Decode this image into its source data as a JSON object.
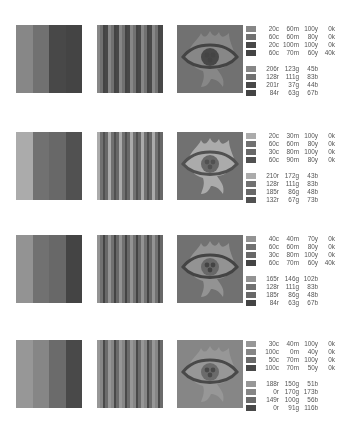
{
  "sets": [
    {
      "top": 25,
      "colors_rgb": [
        "#ce7b2d",
        "#806f53",
        "#c9252c",
        "#543f43"
      ],
      "cmyk": [
        {
          "c": "20c",
          "m": "60m",
          "y": "100y",
          "k": "0k"
        },
        {
          "c": "60c",
          "m": "60m",
          "y": "80y",
          "k": "0k"
        },
        {
          "c": "20c",
          "m": "100m",
          "y": "100y",
          "k": "0k"
        },
        {
          "c": "60c",
          "m": "70m",
          "y": "60y",
          "k": "40k"
        }
      ],
      "rgb": [
        {
          "r": "206r",
          "g": "123g",
          "b": "45b"
        },
        {
          "r": "128r",
          "g": "111g",
          "b": "83b"
        },
        {
          "r": "201r",
          "g": "37g",
          "b": "44b"
        },
        {
          "r": "84r",
          "g": "63g",
          "b": "67b"
        }
      ]
    },
    {
      "top": 132,
      "colors_rgb": [
        "#d2ac2b",
        "#806f53",
        "#b95630",
        "#844349"
      ],
      "cmyk": [
        {
          "c": "20c",
          "m": "30m",
          "y": "100y",
          "k": "0k"
        },
        {
          "c": "60c",
          "m": "60m",
          "y": "80y",
          "k": "0k"
        },
        {
          "c": "30c",
          "m": "80m",
          "y": "100y",
          "k": "0k"
        },
        {
          "c": "60c",
          "m": "90m",
          "y": "80y",
          "k": "0k"
        }
      ],
      "rgb": [
        {
          "r": "210r",
          "g": "172g",
          "b": "43b"
        },
        {
          "r": "128r",
          "g": "111g",
          "b": "83b"
        },
        {
          "r": "185r",
          "g": "86g",
          "b": "48b"
        },
        {
          "r": "132r",
          "g": "67g",
          "b": "73b"
        }
      ]
    },
    {
      "top": 235,
      "colors_rgb": [
        "#a59266",
        "#806f53",
        "#b95630",
        "#543f43"
      ],
      "cmyk": [
        {
          "c": "40c",
          "m": "40m",
          "y": "70y",
          "k": "0k"
        },
        {
          "c": "60c",
          "m": "60m",
          "y": "80y",
          "k": "0k"
        },
        {
          "c": "30c",
          "m": "80m",
          "y": "100y",
          "k": "0k"
        },
        {
          "c": "60c",
          "m": "70m",
          "y": "60y",
          "k": "40k"
        }
      ],
      "rgb": [
        {
          "r": "165r",
          "g": "146g",
          "b": "102b"
        },
        {
          "r": "128r",
          "g": "111g",
          "b": "83b"
        },
        {
          "r": "185r",
          "g": "86g",
          "b": "48b"
        },
        {
          "r": "84r",
          "g": "63g",
          "b": "67b"
        }
      ]
    },
    {
      "top": 340,
      "colors_rgb": [
        "#bc9633",
        "#00aaad",
        "#956438",
        "#005b74"
      ],
      "cmyk": [
        {
          "c": "30c",
          "m": "40m",
          "y": "100y",
          "k": "0k"
        },
        {
          "c": "100c",
          "m": "0m",
          "y": "40y",
          "k": "0k"
        },
        {
          "c": "50c",
          "m": "70m",
          "y": "100y",
          "k": "0k"
        },
        {
          "c": "100c",
          "m": "70m",
          "y": "50y",
          "k": "0k"
        }
      ],
      "rgb": [
        {
          "r": "188r",
          "g": "150g",
          "b": "51b"
        },
        {
          "r": "0r",
          "g": "170g",
          "b": "173b"
        },
        {
          "r": "149r",
          "g": "100g",
          "b": "56b"
        },
        {
          "r": "0r",
          "g": "91g",
          "b": "116b"
        }
      ]
    }
  ]
}
